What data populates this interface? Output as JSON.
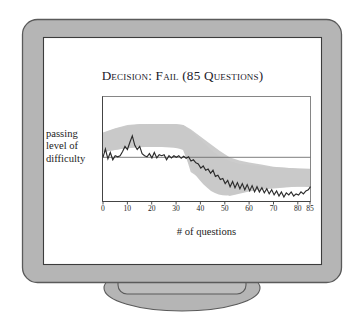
{
  "scene": {
    "name": "computer-monitor-illustration",
    "background_color": "#ffffff",
    "bezel_fill": "#b5b5b5",
    "bezel_stroke": "#5a5a5a",
    "screen_fill": "#ffffff",
    "screen_stroke": "#3c3c3c",
    "stand_fill": "#b5b5b5",
    "stand_stroke": "#5a5a5a"
  },
  "chart": {
    "title": "Decision: Fail (85 Questions)",
    "y_axis_label_lines": [
      "passing",
      "level of",
      "difficulty"
    ],
    "x_axis_caption": "# of questions",
    "line_color": "#2b2b2b",
    "band_color": "#c9c9c9",
    "threshold_color": "#6e6e6e",
    "frame_color": "#7a7a7a"
  },
  "chart_data": {
    "type": "line",
    "title": "Decision: Fail (85 Questions)",
    "xlabel": "# of questions",
    "ylabel": "passing level of difficulty",
    "xlim": [
      0,
      85
    ],
    "ylim": [
      0,
      100
    ],
    "grid": false,
    "legend": null,
    "xticks": [
      0,
      10,
      20,
      30,
      40,
      50,
      60,
      70,
      80,
      85
    ],
    "xticklabels": [
      "0",
      "10",
      "20",
      "30",
      "40",
      "50",
      "60",
      "70",
      "80",
      "85"
    ],
    "yticks": [],
    "annotations": [
      {
        "name": "passing-threshold-line",
        "type": "hline",
        "y": 57,
        "label": "passing level of difficulty"
      }
    ],
    "series": [
      {
        "name": "estimated ability",
        "style": "jagged-line",
        "x": [
          0,
          1,
          2,
          3,
          4,
          5,
          6,
          7,
          8,
          9,
          10,
          11,
          12,
          13,
          14,
          15,
          16,
          17,
          18,
          19,
          20,
          21,
          22,
          23,
          24,
          25,
          26,
          27,
          28,
          29,
          30,
          31,
          32,
          33,
          34,
          35,
          36,
          37,
          38,
          39,
          40,
          41,
          42,
          43,
          44,
          45,
          46,
          47,
          48,
          49,
          50,
          51,
          52,
          53,
          54,
          55,
          56,
          57,
          58,
          59,
          60,
          61,
          62,
          63,
          64,
          65,
          66,
          67,
          68,
          69,
          70,
          71,
          72,
          73,
          74,
          75,
          76,
          77,
          78,
          79,
          80,
          81,
          82,
          83,
          84,
          85
        ],
        "values": [
          57,
          65,
          54,
          60,
          53,
          57,
          56,
          57,
          61,
          66,
          63,
          70,
          76,
          67,
          63,
          66,
          59,
          57,
          56,
          59,
          55,
          60,
          55,
          58,
          57,
          58,
          53,
          57,
          55,
          57,
          56,
          57,
          56,
          57,
          55,
          57,
          54,
          55,
          53,
          52,
          47,
          49,
          44,
          45,
          41,
          44,
          38,
          39,
          35,
          36,
          30,
          33,
          28,
          32,
          26,
          31,
          26,
          30,
          25,
          29,
          24,
          30,
          25,
          29,
          24,
          28,
          23,
          28,
          23,
          27,
          22,
          26,
          21,
          25,
          20,
          24,
          19,
          23,
          18,
          21,
          17,
          20,
          18,
          21,
          20,
          24
        ]
      },
      {
        "name": "confidence band upper",
        "style": "band-edge",
        "x": [
          0,
          5,
          10,
          15,
          20,
          25,
          30,
          33,
          36,
          40,
          44,
          48,
          52,
          56,
          60,
          65,
          70,
          75,
          80,
          85
        ],
        "values": [
          66,
          70,
          73,
          74,
          74,
          74,
          74,
          73,
          69,
          62,
          55,
          48,
          42,
          39,
          37,
          35,
          33,
          32,
          31,
          31
        ]
      },
      {
        "name": "confidence band lower",
        "style": "band-edge",
        "x": [
          0,
          5,
          10,
          15,
          20,
          25,
          30,
          33,
          36,
          40,
          44,
          48,
          52,
          56,
          60,
          65,
          70,
          75,
          80,
          85
        ],
        "values": [
          47,
          49,
          51,
          52,
          52,
          52,
          52,
          51,
          47,
          41,
          35,
          29,
          24,
          22,
          20,
          18,
          16,
          15,
          14,
          14
        ]
      }
    ]
  }
}
